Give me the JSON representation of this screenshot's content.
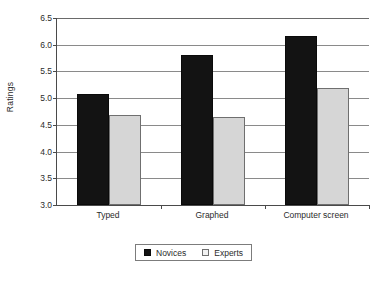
{
  "chart_data": {
    "type": "bar",
    "title": "",
    "xlabel": "",
    "ylabel": "Ratings",
    "categories": [
      "Typed",
      "Graphed",
      "Computer screen"
    ],
    "series": [
      {
        "name": "Novices",
        "color": "#131313",
        "values": [
          5.08,
          5.8,
          6.17
        ]
      },
      {
        "name": "Experts",
        "color": "#d6d6d6",
        "values": [
          4.69,
          4.65,
          5.19
        ]
      }
    ],
    "ylim": [
      3.0,
      6.5
    ],
    "ytick_step": 0.5,
    "yticks": [
      "6.5",
      "6.0",
      "5.5",
      "5.0",
      "4.5",
      "4.0",
      "3.5",
      "3.0"
    ],
    "ytick_values": [
      6.5,
      6.0,
      5.5,
      5.0,
      4.5,
      4.0,
      3.5,
      3.0
    ],
    "grid": true,
    "grid_axis": "y",
    "legend_position": "bottom-center",
    "legend_entries": [
      "Novices",
      "Experts"
    ],
    "axis_color": "#4a4a4a",
    "grid_color": "#8a8a8a",
    "background": "#ffffff"
  }
}
